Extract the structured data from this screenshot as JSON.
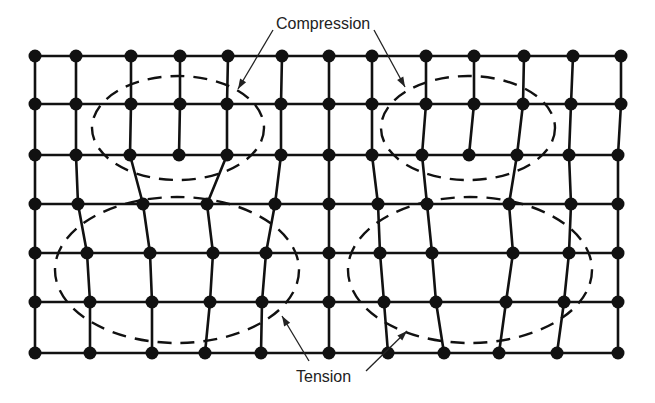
{
  "colors": {
    "ink": "#111111",
    "background": "#ffffff"
  },
  "labels": {
    "compression": "Compression",
    "tension": "Tension"
  },
  "grid": {
    "rows": [
      {
        "y": 56,
        "x": [
          35,
          76,
          131,
          180,
          228,
          282,
          329,
          372,
          426,
          474,
          524,
          573,
          621
        ]
      },
      {
        "y": 104,
        "x": [
          35,
          76,
          131,
          180,
          227,
          281,
          329,
          372,
          426,
          474,
          523,
          571,
          621
        ]
      },
      {
        "y": 155,
        "x": [
          35,
          76,
          130,
          179,
          227,
          281,
          329,
          372,
          422,
          469,
          517,
          569,
          618
        ]
      },
      {
        "y": 204,
        "x": [
          35,
          78,
          143,
          207,
          275,
          329,
          378,
          427,
          509,
          571,
          618
        ]
      },
      {
        "y": 253,
        "x": [
          35,
          87,
          150,
          213,
          266,
          329,
          380,
          432,
          513,
          569,
          618
        ]
      },
      {
        "y": 302,
        "x": [
          35,
          90,
          152,
          210,
          262,
          329,
          384,
          436,
          506,
          564,
          618
        ]
      },
      {
        "y": 353,
        "x": [
          35,
          90,
          152,
          205,
          261,
          329,
          388,
          444,
          499,
          557,
          618
        ]
      }
    ],
    "vertical_lines": [
      [
        [
          35,
          56
        ],
        [
          35,
          104
        ],
        [
          35,
          155
        ],
        [
          35,
          204
        ],
        [
          35,
          253
        ],
        [
          35,
          302
        ],
        [
          35,
          353
        ]
      ],
      [
        [
          76,
          56
        ],
        [
          76,
          104
        ],
        [
          76,
          155
        ],
        [
          78,
          204
        ],
        [
          87,
          253
        ],
        [
          90,
          302
        ],
        [
          90,
          353
        ]
      ],
      [
        [
          131,
          56
        ],
        [
          131,
          104
        ],
        [
          130,
          155
        ],
        [
          143,
          204
        ],
        [
          150,
          253
        ],
        [
          152,
          302
        ],
        [
          152,
          353
        ]
      ],
      [
        [
          180,
          56
        ],
        [
          180,
          104
        ],
        [
          179,
          155
        ]
      ],
      [
        [
          228,
          56
        ],
        [
          227,
          104
        ],
        [
          227,
          155
        ],
        [
          207,
          204
        ],
        [
          213,
          253
        ],
        [
          210,
          302
        ],
        [
          205,
          353
        ]
      ],
      [
        [
          282,
          56
        ],
        [
          281,
          104
        ],
        [
          281,
          155
        ],
        [
          275,
          204
        ],
        [
          266,
          253
        ],
        [
          262,
          302
        ],
        [
          261,
          353
        ]
      ],
      [
        [
          329,
          56
        ],
        [
          329,
          104
        ],
        [
          329,
          155
        ],
        [
          329,
          204
        ],
        [
          329,
          253
        ],
        [
          329,
          302
        ],
        [
          329,
          353
        ]
      ],
      [
        [
          372,
          56
        ],
        [
          372,
          104
        ],
        [
          372,
          155
        ],
        [
          378,
          204
        ],
        [
          380,
          253
        ],
        [
          384,
          302
        ],
        [
          388,
          353
        ]
      ],
      [
        [
          426,
          56
        ],
        [
          426,
          104
        ],
        [
          422,
          155
        ],
        [
          427,
          204
        ],
        [
          432,
          253
        ],
        [
          436,
          302
        ],
        [
          444,
          353
        ]
      ],
      [
        [
          474,
          56
        ],
        [
          474,
          104
        ],
        [
          469,
          155
        ]
      ],
      [
        [
          524,
          56
        ],
        [
          523,
          104
        ],
        [
          517,
          155
        ],
        [
          509,
          204
        ],
        [
          513,
          253
        ],
        [
          506,
          302
        ],
        [
          499,
          353
        ]
      ],
      [
        [
          573,
          56
        ],
        [
          571,
          104
        ],
        [
          569,
          155
        ],
        [
          571,
          204
        ],
        [
          569,
          253
        ],
        [
          564,
          302
        ],
        [
          557,
          353
        ]
      ],
      [
        [
          621,
          56
        ],
        [
          621,
          104
        ],
        [
          618,
          155
        ],
        [
          618,
          204
        ],
        [
          618,
          253
        ],
        [
          618,
          302
        ],
        [
          618,
          353
        ]
      ]
    ]
  },
  "zones": [
    {
      "type": "compression",
      "cx": 178,
      "cy": 128,
      "rx": 86,
      "ry": 52
    },
    {
      "type": "compression",
      "cx": 468,
      "cy": 128,
      "rx": 87,
      "ry": 52
    },
    {
      "type": "tension",
      "cx": 177,
      "cy": 270,
      "rx": 122,
      "ry": 73
    },
    {
      "type": "tension",
      "cx": 470,
      "cy": 270,
      "rx": 122,
      "ry": 73
    }
  ],
  "leaders": [
    {
      "target": "compression",
      "from": [
        273,
        30
      ],
      "to": [
        238,
        89
      ]
    },
    {
      "target": "compression",
      "from": [
        374,
        30
      ],
      "to": [
        405,
        87
      ]
    },
    {
      "target": "tension",
      "from": [
        309,
        361
      ],
      "to": [
        282,
        316
      ]
    },
    {
      "target": "tension",
      "from": [
        366,
        371
      ],
      "to": [
        407,
        331
      ]
    }
  ]
}
